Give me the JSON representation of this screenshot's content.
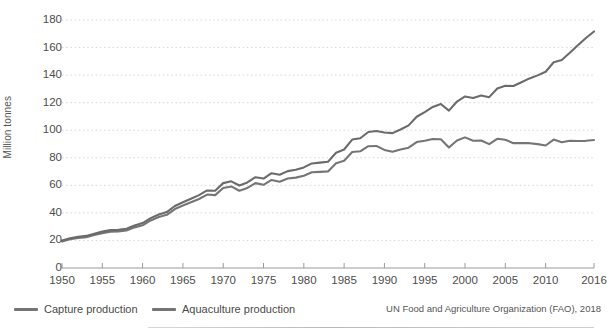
{
  "chart_data": {
    "type": "line",
    "title": "",
    "xlabel": "",
    "ylabel": "Million tonnes",
    "xlim": [
      1950,
      2016
    ],
    "ylim": [
      0,
      180
    ],
    "grid": true,
    "legend_position": "bottom-left",
    "source": "UN Food and Agriculture Organization (FAO), 2018",
    "ytick_labels": [
      "0",
      "20",
      "40",
      "60",
      "80",
      "100",
      "120",
      "140",
      "160",
      "180"
    ],
    "ytick_values": [
      0,
      20,
      40,
      60,
      80,
      100,
      120,
      140,
      160,
      180
    ],
    "xtick_labels": [
      "1950",
      "1955",
      "1960",
      "1965",
      "1970",
      "1975",
      "1980",
      "1985",
      "1990",
      "1995",
      "2000",
      "2005",
      "2010",
      "2016"
    ],
    "xtick_values": [
      1950,
      1955,
      1960,
      1965,
      1970,
      1975,
      1980,
      1985,
      1990,
      1995,
      2000,
      2005,
      2010,
      2016
    ],
    "x": [
      1950,
      1951,
      1952,
      1953,
      1954,
      1955,
      1956,
      1957,
      1958,
      1959,
      1960,
      1961,
      1962,
      1963,
      1964,
      1965,
      1966,
      1967,
      1968,
      1969,
      1970,
      1971,
      1972,
      1973,
      1974,
      1975,
      1976,
      1977,
      1978,
      1979,
      1980,
      1981,
      1982,
      1983,
      1984,
      1985,
      1986,
      1987,
      1988,
      1989,
      1990,
      1991,
      1992,
      1993,
      1994,
      1995,
      1996,
      1997,
      1998,
      1999,
      2000,
      2001,
      2002,
      2003,
      2004,
      2005,
      2006,
      2007,
      2008,
      2009,
      2010,
      2011,
      2012,
      2013,
      2014,
      2015,
      2016
    ],
    "series": [
      {
        "name": "Capture production",
        "color": "#757575",
        "values": [
          19.3,
          20.8,
          21.8,
          22.4,
          23.9,
          25.3,
          26.4,
          26.5,
          27.2,
          29.5,
          31.0,
          34.5,
          37.0,
          38.6,
          42.8,
          45.3,
          47.7,
          50.1,
          53.3,
          52.9,
          58.1,
          59.2,
          56.1,
          58.1,
          61.6,
          60.4,
          63.9,
          62.6,
          64.9,
          65.6,
          67.0,
          69.5,
          69.8,
          70.1,
          76.1,
          77.9,
          84.2,
          84.7,
          88.4,
          88.6,
          85.7,
          84.4,
          86.0,
          87.3,
          91.4,
          92.3,
          93.6,
          93.4,
          87.4,
          92.6,
          94.8,
          92.4,
          92.5,
          89.9,
          93.8,
          93.1,
          90.6,
          90.6,
          90.6,
          89.9,
          88.9,
          93.2,
          91.3,
          92.3,
          92.2,
          92.3,
          92.9
        ]
      },
      {
        "name": "Aquaculture production",
        "color": "#6b6b6b",
        "values": [
          20.0,
          21.6,
          22.7,
          23.3,
          24.9,
          26.4,
          27.5,
          27.7,
          28.5,
          30.9,
          32.6,
          36.2,
          38.8,
          40.6,
          45.0,
          47.7,
          50.3,
          52.9,
          56.3,
          56.1,
          61.6,
          62.9,
          59.9,
          62.1,
          65.9,
          64.9,
          68.8,
          67.7,
          70.3,
          71.3,
          73.0,
          75.9,
          76.5,
          77.1,
          83.7,
          86.0,
          93.2,
          94.2,
          98.7,
          99.4,
          98.4,
          97.9,
          100.5,
          103.5,
          109.8,
          113.2,
          116.9,
          119.0,
          114.2,
          120.8,
          124.5,
          123.4,
          125.2,
          124.0,
          130.3,
          132.2,
          132.1,
          134.8,
          137.6,
          139.8,
          142.4,
          149.3,
          151.0,
          156.2,
          161.6,
          166.9,
          171.7
        ]
      }
    ]
  },
  "legend": {
    "items": [
      {
        "label": "Capture production"
      },
      {
        "label": "Aquaculture production"
      }
    ]
  },
  "colors": {
    "line": "#6b6b6b",
    "grid": "#d9d9d9",
    "axis": "#9a9a9a",
    "text": "#4d4d4d",
    "background": "#ffffff"
  }
}
